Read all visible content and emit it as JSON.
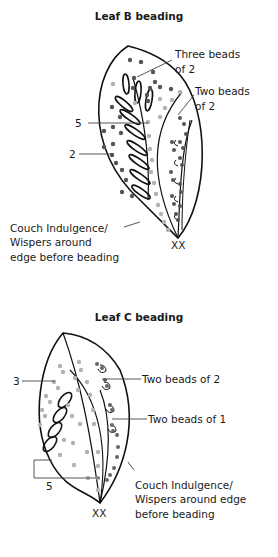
{
  "leaf_b": {
    "title": "Leaf B beading",
    "labels": {
      "three_beads_line1": "Three beads",
      "three_beads_line2": "of 2",
      "two_beads_line1": "Two beads",
      "two_beads_line2": "of 2",
      "num_5": "5",
      "num_2": "2",
      "couch_line1": "Couch Indulgence/",
      "couch_line2": "Wispers around",
      "couch_line3": "edge before beading",
      "xx": "XX"
    }
  },
  "leaf_c": {
    "title": "Leaf C beading",
    "labels": {
      "num_3": "3",
      "two_beads_of_2": "Two beads of 2",
      "two_beads_of_1": "Two beads of 1",
      "num_5": "5",
      "couch_line1": "Couch Indulgence/",
      "couch_line2": "Wispers around edge",
      "couch_line3": "before beading",
      "xx": "XX"
    }
  },
  "colors": {
    "outline": "#111111",
    "dark_bead": "#555555",
    "light_bead": "#b3b3b3",
    "leader": "#444444"
  }
}
